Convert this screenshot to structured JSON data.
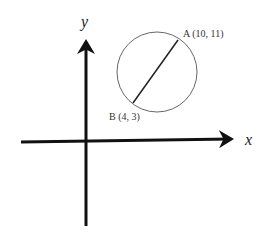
{
  "diagram": {
    "axes": {
      "x_label": "x",
      "y_label": "y"
    },
    "circle": {
      "diameter_endpoints": [
        "A",
        "B"
      ]
    },
    "points": [
      {
        "name": "A",
        "label": "A (10, 11)",
        "x": 10,
        "y": 11
      },
      {
        "name": "B",
        "label": "B (4, 3)",
        "x": 4,
        "y": 3
      }
    ],
    "colors": {
      "axis": "#111111",
      "circle": "#666666",
      "segment": "#222222"
    }
  }
}
